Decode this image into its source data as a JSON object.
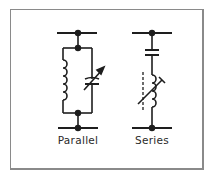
{
  "diagram": {
    "colors": {
      "stroke": "#1e1e1e",
      "frame": "#8a8a8a",
      "text": "#2a2a2a",
      "background": "#ffffff"
    },
    "circuits": [
      {
        "name": "Parallel",
        "label": "Parallel",
        "components": [
          "inductor",
          "variable-capacitor"
        ],
        "arrangement": "parallel"
      },
      {
        "name": "Series",
        "label": "Series",
        "components": [
          "capacitor",
          "variable-inductor-with-core"
        ],
        "arrangement": "series"
      }
    ]
  }
}
